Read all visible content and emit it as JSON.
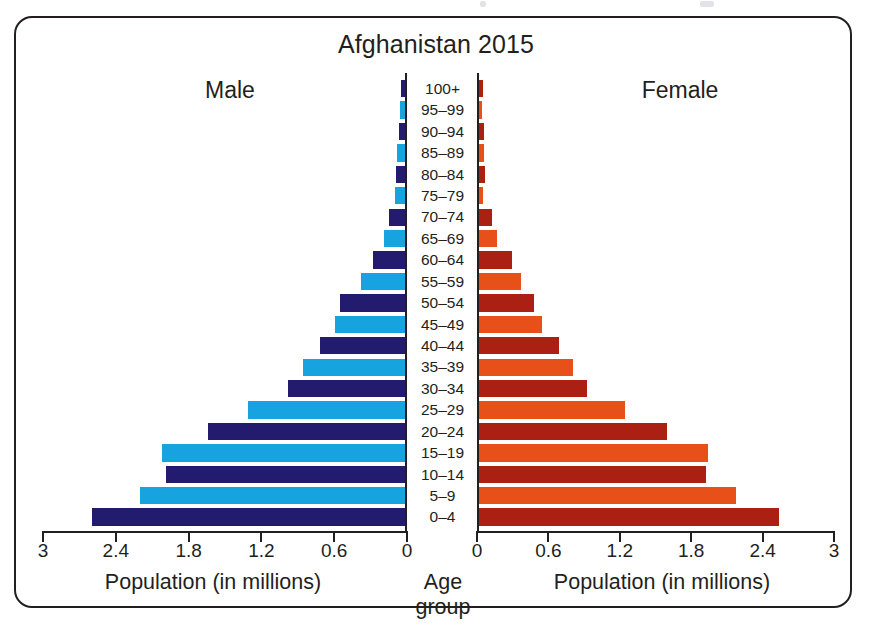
{
  "figure": {
    "title": "Afghanistan 2015",
    "left_label": "Male",
    "right_label": "Female",
    "left_axis_title": "Population (in millions)",
    "centre_axis_title": "Age group",
    "right_axis_title": "Population (in millions)"
  },
  "colors": {
    "male_dark": "#231b6e",
    "male_light": "#17a3e0",
    "female_dark": "#aa2012",
    "female_light": "#e8501a",
    "ink": "#231f20",
    "background": "#ffffff"
  },
  "chart_data": {
    "type": "bar",
    "title": "Afghanistan 2015",
    "subtype": "population-pyramid",
    "xlabel": "Population (in millions)",
    "ylabel": "Age group",
    "xlim": [
      0,
      3
    ],
    "xticks": [
      0,
      0.6,
      1.2,
      1.8,
      2.4,
      3
    ],
    "left_tick_labels": [
      "3",
      "2.4",
      "1.8",
      "1.2",
      "0.6",
      "0"
    ],
    "right_tick_labels": [
      "0",
      "0.6",
      "1.2",
      "1.8",
      "2.4",
      "3"
    ],
    "grid": false,
    "legend": "none",
    "categories": [
      "100+",
      "95–99",
      "90–94",
      "85–89",
      "80–84",
      "75–79",
      "70–74",
      "65–69",
      "60–64",
      "55–59",
      "50–54",
      "45–49",
      "40–44",
      "35–39",
      "30–34",
      "25–29",
      "20–24",
      "15–19",
      "10–14",
      "5–9",
      "0–4"
    ],
    "series": [
      {
        "name": "Male",
        "side": "left",
        "values": [
          0.05,
          0.06,
          0.07,
          0.08,
          0.09,
          0.1,
          0.15,
          0.19,
          0.28,
          0.38,
          0.55,
          0.59,
          0.72,
          0.86,
          0.98,
          1.31,
          1.64,
          2.02,
          1.99,
          2.2,
          2.6
        ]
      },
      {
        "name": "Female",
        "side": "right",
        "values": [
          0.04,
          0.03,
          0.05,
          0.05,
          0.06,
          0.04,
          0.12,
          0.16,
          0.29,
          0.36,
          0.47,
          0.54,
          0.68,
          0.8,
          0.92,
          1.24,
          1.59,
          1.94,
          1.92,
          2.17,
          2.54
        ]
      }
    ]
  }
}
